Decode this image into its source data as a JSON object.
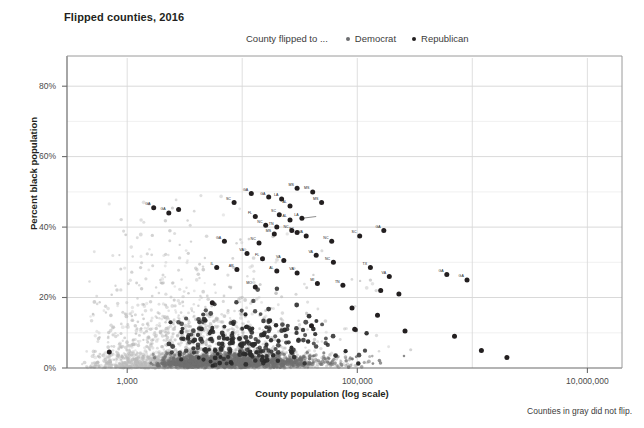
{
  "chart": {
    "title": "Flipped counties, 2016",
    "footnote": "Counties in gray did not flip.",
    "legend": {
      "caption": "County flipped to ...",
      "entries": [
        {
          "label": "Democrat",
          "color": "#6d6e71"
        },
        {
          "label": "Republican",
          "color": "#231f20"
        }
      ]
    }
  },
  "chart_data": {
    "type": "scatter",
    "title": "Flipped counties, 2016",
    "xlabel": "County population (log scale)",
    "ylabel": "Percent black population",
    "xscale": "log",
    "xlim": [
      300,
      20000000
    ],
    "ylim": [
      0,
      88
    ],
    "xticks": [
      1000,
      100000,
      10000000
    ],
    "xticklabels": [
      "1,000",
      "100,000",
      "10,000,000"
    ],
    "yticks": [
      0,
      20,
      40,
      60,
      80
    ],
    "yticklabels": [
      "0%",
      "20%",
      "40%",
      "60%",
      "80%"
    ],
    "grid": true,
    "legend_position": "top",
    "series": [
      {
        "name": "Did not flip",
        "color": "#c9c9c9",
        "marker": "circle",
        "note": "background cloud of US counties, population vs percent black population"
      },
      {
        "name": "Republican",
        "color": "#231f20",
        "marker": "circle",
        "points": [
          {
            "x": 1700,
            "y": 45.5,
            "label": "GA"
          },
          {
            "x": 2300,
            "y": 44.0,
            "label": "GA"
          },
          {
            "x": 2800,
            "y": 45.0,
            "label": ""
          },
          {
            "x": 8500,
            "y": 47.0,
            "label": "SC"
          },
          {
            "x": 12000,
            "y": 49.5,
            "label": "GA"
          },
          {
            "x": 17000,
            "y": 48.5,
            "label": "GA"
          },
          {
            "x": 22000,
            "y": 48.0,
            "label": "LA"
          },
          {
            "x": 30000,
            "y": 51.0,
            "label": "MS"
          },
          {
            "x": 41000,
            "y": 50.0,
            "label": "MS"
          },
          {
            "x": 49000,
            "y": 47.0,
            "label": "MS"
          },
          {
            "x": 26000,
            "y": 46.0,
            "label": "AL"
          },
          {
            "x": 13000,
            "y": 43.0,
            "label": "FL"
          },
          {
            "x": 21000,
            "y": 43.5,
            "label": "SC"
          },
          {
            "x": 26000,
            "y": 42.0,
            "label": "AL"
          },
          {
            "x": 33000,
            "y": 42.5,
            "label": "LA"
          },
          {
            "x": 16000,
            "y": 40.5,
            "label": "NC"
          },
          {
            "x": 20000,
            "y": 40.0,
            "label": "TN"
          },
          {
            "x": 27000,
            "y": 39.0,
            "label": "NC"
          },
          {
            "x": 30000,
            "y": 38.5,
            "label": "SC"
          },
          {
            "x": 19000,
            "y": 38.0,
            "label": "MS"
          },
          {
            "x": 36000,
            "y": 37.5,
            "label": "VA"
          },
          {
            "x": 7000,
            "y": 36.0,
            "label": "GA"
          },
          {
            "x": 14000,
            "y": 35.5,
            "label": "NC"
          },
          {
            "x": 60000,
            "y": 36.0,
            "label": "NC"
          },
          {
            "x": 105000,
            "y": 37.5,
            "label": "SC"
          },
          {
            "x": 170000,
            "y": 39.0,
            "label": "GA"
          },
          {
            "x": 11000,
            "y": 32.5,
            "label": "VA"
          },
          {
            "x": 15000,
            "y": 31.0,
            "label": "FL"
          },
          {
            "x": 23000,
            "y": 30.5,
            "label": "VA"
          },
          {
            "x": 44000,
            "y": 32.0,
            "label": "VA"
          },
          {
            "x": 62000,
            "y": 30.0,
            "label": "NC"
          },
          {
            "x": 6000,
            "y": 28.5,
            "label": "IL"
          },
          {
            "x": 9000,
            "y": 28.0,
            "label": "AR"
          },
          {
            "x": 20000,
            "y": 27.5,
            "label": "AL"
          },
          {
            "x": 30000,
            "y": 27.0,
            "label": "VA"
          },
          {
            "x": 130000,
            "y": 28.5,
            "label": "TX"
          },
          {
            "x": 190000,
            "y": 26.0,
            "label": "VA"
          },
          {
            "x": 600000,
            "y": 26.5,
            "label": "GA"
          },
          {
            "x": 900000,
            "y": 25.0,
            "label": "GA"
          },
          {
            "x": 13000,
            "y": 23.0,
            "label": "MO"
          },
          {
            "x": 45000,
            "y": 24.0,
            "label": "MI"
          },
          {
            "x": 75000,
            "y": 23.5,
            "label": "TN"
          },
          {
            "x": 160000,
            "y": 22.0,
            "label": ""
          },
          {
            "x": 230000,
            "y": 21.0,
            "label": ""
          },
          {
            "x": 5500,
            "y": 18.5,
            "label": ""
          },
          {
            "x": 90000,
            "y": 17.0,
            "label": ""
          },
          {
            "x": 150000,
            "y": 15.0,
            "label": ""
          },
          {
            "x": 40000,
            "y": 12.0,
            "label": ""
          },
          {
            "x": 95000,
            "y": 11.0,
            "label": ""
          },
          {
            "x": 260000,
            "y": 10.5,
            "label": ""
          },
          {
            "x": 700,
            "y": 4.5,
            "label": ""
          },
          {
            "x": 700000,
            "y": 9.0,
            "label": ""
          },
          {
            "x": 1200000,
            "y": 5.0,
            "label": ""
          },
          {
            "x": 2000000,
            "y": 3.0,
            "label": ""
          }
        ]
      },
      {
        "name": "Democrat",
        "color": "#4a4a4a",
        "marker": "circle",
        "note": "small number of counties flipped to Democrat, clustered near low percent black population"
      }
    ]
  },
  "axes": {
    "y": {
      "title": "Percent black population",
      "ticks": [
        "0%",
        "20%",
        "40%",
        "60%",
        "80%"
      ]
    },
    "x": {
      "title": "County population (log scale)",
      "ticks": [
        "1,000",
        "100,000",
        "10,000,000"
      ]
    }
  }
}
